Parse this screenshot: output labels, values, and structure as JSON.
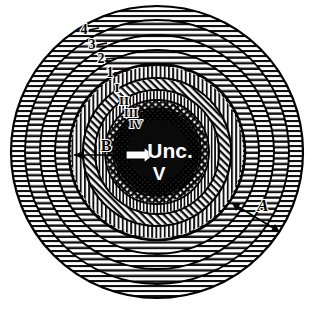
{
  "figure": {
    "center_label_primary": "Unc.",
    "center_label_secondary": "V",
    "background_color": "#ffffff",
    "ink_color": "#000000"
  },
  "outer_zone_labels": [
    {
      "name": "zone-4",
      "text": "4",
      "x": 84,
      "y": 34
    },
    {
      "name": "zone-3",
      "text": "3",
      "x": 92,
      "y": 49
    },
    {
      "name": "zone-2",
      "text": "2",
      "x": 101,
      "y": 63
    },
    {
      "name": "zone-1",
      "text": "1",
      "x": 110,
      "y": 76
    }
  ],
  "inner_zone_labels": [
    {
      "name": "zone-I",
      "text": "I",
      "x": 116,
      "y": 90
    },
    {
      "name": "zone-II",
      "text": "II",
      "x": 123,
      "y": 104
    },
    {
      "name": "zone-III",
      "text": "III",
      "x": 130,
      "y": 116
    },
    {
      "name": "zone-IV",
      "text": "IV",
      "x": 134,
      "y": 127
    }
  ],
  "measure_arrows": [
    {
      "name": "arrow-A",
      "label": "A",
      "label_x": 263,
      "label_y": 211,
      "x1": 232,
      "y1": 203,
      "x2": 280,
      "y2": 232
    },
    {
      "name": "arrow-B",
      "label": "B",
      "label_x": 106,
      "label_y": 150,
      "x1": 74,
      "y1": 155,
      "x2": 142,
      "y2": 155
    }
  ],
  "core_arrow": {
    "name": "core-arrow",
    "x1": 128,
    "y1": 155,
    "x2": 152,
    "y2": 155
  },
  "geometry": {
    "cx": 157,
    "cy": 152,
    "ring_radii": [
      146,
      132,
      117,
      102,
      88,
      74,
      62,
      52,
      44,
      30
    ],
    "outer_band_count": 5,
    "hatch_outer": "horizontal",
    "hatch_inner": "vertical",
    "hatch_core": "cross"
  }
}
